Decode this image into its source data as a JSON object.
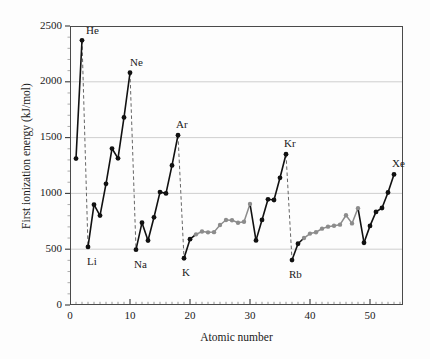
{
  "chart_data": {
    "type": "line",
    "title": "",
    "xlabel": "Atomic number",
    "ylabel": "First ionization energy (kJ/mol)",
    "xlim": [
      0,
      55.5
    ],
    "ylim": [
      0,
      2500
    ],
    "xticks": [
      0,
      10,
      20,
      30,
      40,
      50
    ],
    "yticks": [
      0,
      500,
      1000,
      1500,
      2000,
      2500
    ],
    "grid": "horizontal",
    "legend": "none",
    "x": [
      1,
      2,
      3,
      4,
      5,
      6,
      7,
      8,
      9,
      10,
      11,
      12,
      13,
      14,
      15,
      16,
      17,
      18,
      19,
      20,
      21,
      22,
      23,
      24,
      25,
      26,
      27,
      28,
      29,
      30,
      31,
      32,
      33,
      34,
      35,
      36,
      37,
      38,
      39,
      40,
      41,
      42,
      43,
      44,
      45,
      46,
      47,
      48,
      49,
      50,
      51,
      52,
      53,
      54
    ],
    "values": [
      1312,
      2372,
      520,
      899,
      801,
      1086,
      1402,
      1314,
      1681,
      2081,
      496,
      738,
      578,
      786,
      1012,
      1000,
      1251,
      1521,
      419,
      590,
      633,
      659,
      651,
      653,
      717,
      762,
      760,
      737,
      746,
      906,
      579,
      762,
      947,
      941,
      1140,
      1351,
      403,
      549,
      600,
      640,
      652,
      684,
      702,
      710,
      720,
      804,
      731,
      868,
      558,
      709,
      834,
      869,
      1008,
      1170
    ],
    "element_symbols": [
      "H",
      "He",
      "Li",
      "Be",
      "B",
      "C",
      "N",
      "O",
      "F",
      "Ne",
      "Na",
      "Mg",
      "Al",
      "Si",
      "P",
      "S",
      "Cl",
      "Ar",
      "K",
      "Ca",
      "Sc",
      "Ti",
      "V",
      "Cr",
      "Mn",
      "Fe",
      "Co",
      "Ni",
      "Cu",
      "Zn",
      "Ga",
      "Ge",
      "As",
      "Se",
      "Br",
      "Kr",
      "Rb",
      "Sr",
      "Y",
      "Zr",
      "Nb",
      "Mo",
      "Tc",
      "Ru",
      "Rh",
      "Pd",
      "Ag",
      "Cd",
      "In",
      "Sn",
      "Sb",
      "Te",
      "I",
      "Xe"
    ],
    "transition_metal_ranges": [
      [
        21,
        30
      ],
      [
        39,
        48
      ]
    ],
    "annotations": [
      {
        "text": "He",
        "z": 2,
        "value": 2372,
        "dx": 4,
        "dy": -16
      },
      {
        "text": "Li",
        "z": 3,
        "value": 520,
        "dx": -1,
        "dy": 8
      },
      {
        "text": "Ne",
        "z": 10,
        "value": 2081,
        "dx": 0,
        "dy": -17
      },
      {
        "text": "Na",
        "z": 11,
        "value": 496,
        "dx": -2,
        "dy": 8
      },
      {
        "text": "Ar",
        "z": 18,
        "value": 1521,
        "dx": -2,
        "dy": -17
      },
      {
        "text": "K",
        "z": 19,
        "value": 419,
        "dx": -2,
        "dy": 8
      },
      {
        "text": "Kr",
        "z": 36,
        "value": 1351,
        "dx": -2,
        "dy": -17
      },
      {
        "text": "Rb",
        "z": 37,
        "value": 403,
        "dx": -3,
        "dy": 8
      },
      {
        "text": "Xe",
        "z": 54,
        "value": 1170,
        "dx": -2,
        "dy": -17
      }
    ],
    "dashed_connectors": [
      {
        "from_z": 2,
        "to_z": 3
      },
      {
        "from_z": 10,
        "to_z": 11
      },
      {
        "from_z": 18,
        "to_z": 19
      },
      {
        "from_z": 36,
        "to_z": 37
      }
    ],
    "colors": {
      "line": "#111111",
      "transition_line": "#8c8c8c",
      "marker": "#111111",
      "transition_marker": "#8c8c8c",
      "grid": "#c9c9c9",
      "axis": "#4a4a4a",
      "dashed": "#666666",
      "background": "#fdfdfd"
    }
  }
}
